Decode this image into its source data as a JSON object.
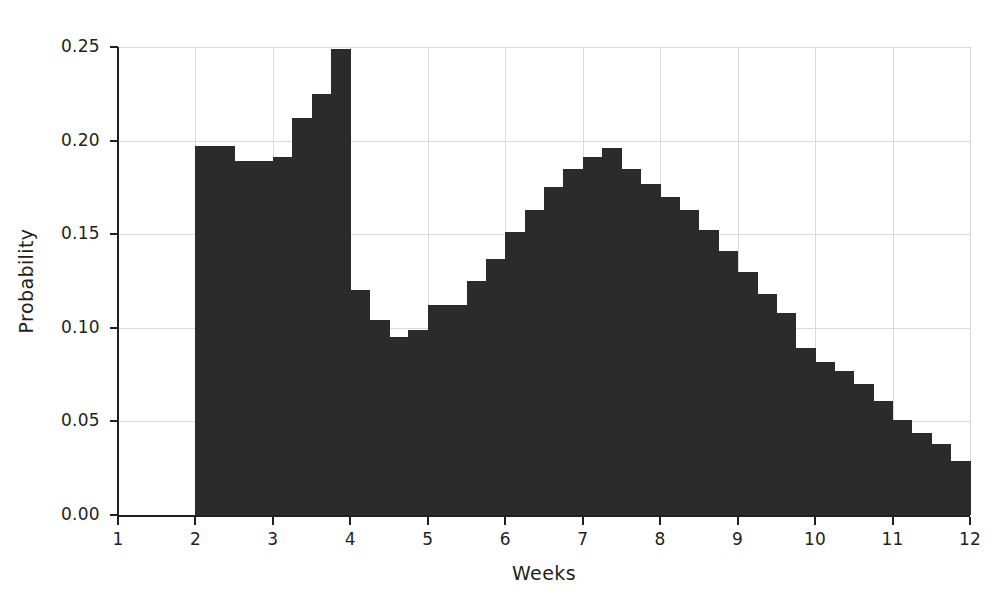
{
  "chart_data": {
    "type": "bar",
    "title": "",
    "subtitle": "",
    "xlabel": "Weeks",
    "ylabel": "Probability",
    "xlim": [
      1,
      12
    ],
    "ylim": [
      0.0,
      0.25
    ],
    "grid": true,
    "legend": null,
    "bar_color": "#2b2b2b",
    "bin_width": 0.25,
    "x_ticks": [
      1,
      2,
      3,
      4,
      5,
      6,
      7,
      8,
      9,
      10,
      11,
      12
    ],
    "x_tick_labels": [
      "1",
      "2",
      "3",
      "4",
      "5",
      "6",
      "7",
      "8",
      "9",
      "10",
      "11",
      "12"
    ],
    "y_ticks": [
      0.0,
      0.05,
      0.1,
      0.15,
      0.2,
      0.25
    ],
    "y_tick_labels": [
      "0.00",
      "0.05",
      "0.10",
      "0.15",
      "0.20",
      "0.25"
    ],
    "bin_left_edges": [
      2.0,
      2.25,
      2.5,
      2.75,
      3.0,
      3.25,
      3.5,
      3.75,
      4.0,
      4.25,
      4.5,
      4.75,
      5.0,
      5.25,
      5.5,
      5.75,
      6.0,
      6.25,
      6.5,
      6.75,
      7.0,
      7.25,
      7.5,
      7.75,
      8.0,
      8.25,
      8.5,
      8.75,
      9.0,
      9.25,
      9.5,
      9.75,
      10.0,
      10.25,
      10.5,
      10.75,
      11.0,
      11.25,
      11.5,
      11.75,
      12.0
    ],
    "values": [
      0.197,
      0.197,
      0.189,
      0.189,
      0.191,
      0.212,
      0.225,
      0.249,
      0.12,
      0.104,
      0.095,
      0.099,
      0.112,
      0.112,
      0.125,
      0.137,
      0.151,
      0.163,
      0.175,
      0.185,
      0.191,
      0.196,
      0.185,
      0.177,
      0.17,
      0.163,
      0.152,
      0.141,
      0.13,
      0.118,
      0.108,
      0.089,
      0.082,
      0.077,
      0.07,
      0.061,
      0.051,
      0.044,
      0.038,
      0.029,
      0.012
    ]
  }
}
